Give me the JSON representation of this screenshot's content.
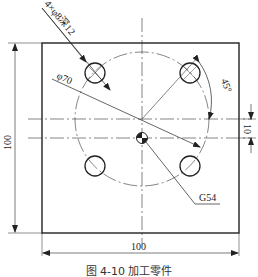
{
  "drawing": {
    "hole_note": "4×φ8深12",
    "bolt_circle_label": "φ70",
    "angle_label": "45°",
    "offset_label": "10",
    "width_label": "100",
    "height_label": "100",
    "origin_label": "G54"
  },
  "caption": "图 4-10  加工零件",
  "colors": {
    "line": "#222222",
    "background": "#ffffff"
  }
}
